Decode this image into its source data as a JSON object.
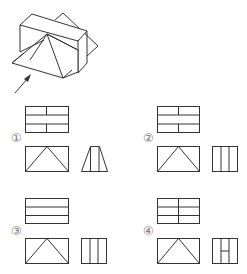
{
  "question": {
    "header_partial": "",
    "arrow_label": "viewing direction arrow"
  },
  "options": [
    {
      "label": "①",
      "top_view": "rect with 2 horizontal lines, vertical divider in top and bottom rows",
      "front_view": "rect with triangle",
      "side_view": "trapezoid with 2 vertical lines"
    },
    {
      "label": "②",
      "top_view": "rect with 2 horizontal lines, vertical divider in top and bottom rows",
      "front_view": "rect with triangle",
      "side_view": "rect with 2 vertical lines"
    },
    {
      "label": "③",
      "top_view": "rect with 2 horizontal lines",
      "front_view": "rect with triangle",
      "side_view": "rect with 2 vertical lines"
    },
    {
      "label": "④",
      "top_view": "rect with 2 horizontal lines, full vertical divider",
      "front_view": "rect with triangle",
      "side_view": "rect with 2 vertical lines and H crossbar"
    }
  ],
  "colors": {
    "line": "#333333",
    "label": "#777777"
  }
}
